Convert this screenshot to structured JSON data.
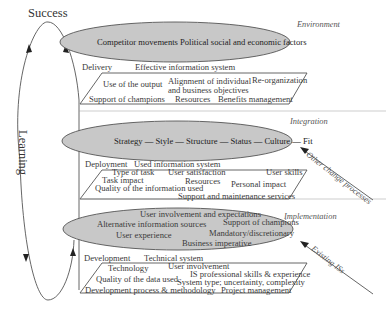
{
  "loop": {
    "top_label": "Success",
    "side_label": "Learning"
  },
  "layers": {
    "environment": {
      "name": "Environment",
      "ellipse": [
        "Competitor movements",
        "Political social and economic factors"
      ],
      "left_label": "Delivery",
      "right_label": "Effective information system",
      "box": [
        "Use of the output",
        "Alignment of individual",
        "and business objectives",
        "Re-organization",
        "Support of champions",
        "Resources",
        "Benefits management"
      ]
    },
    "integration": {
      "name": "Integration",
      "ellipse": [
        "Strategy — Style — Structure — Status — Culture — Fit"
      ],
      "left_label": "Deployment",
      "right_label": "Used information system",
      "box": [
        "Type of task",
        "User satisfaction",
        "User skills",
        "Task impact",
        "Resources",
        "Personal impact",
        "Quality of the information used",
        "Support and maintenance services"
      ],
      "arrow_label": "Other change processes"
    },
    "implementation": {
      "name": "Implementation",
      "ellipse": [
        "User involvement and expectations",
        "Alternative information sources",
        "Support of champions",
        "User experience",
        "Mandatory/discretionary",
        "Business imperative"
      ],
      "left_label": "Development",
      "right_label": "Technical system",
      "box": [
        "Technology",
        "User involvement",
        "IS professional skills & experience",
        "Quality of the data used",
        "System type; uncertainty, complexity",
        "Development process & methodology",
        "Project management"
      ],
      "arrow_label": "Existing ISs"
    }
  },
  "colors": {
    "ellipse_fill": "#c8c8c8",
    "line": "#555555"
  }
}
